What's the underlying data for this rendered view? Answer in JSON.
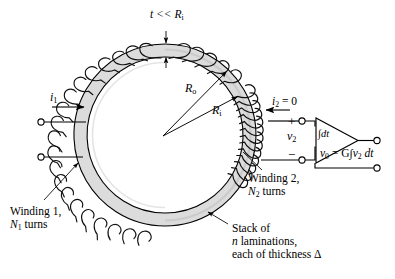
{
  "figure": {
    "colors": {
      "background": "#ffffff",
      "core_fill": "#dcdcdc",
      "core_fill_shade": "#cfcfcf",
      "line": "#000000",
      "wire": "#1a1a1a"
    }
  },
  "labels": {
    "thickness_note": {
      "text": "t << R",
      "sub": "i",
      "prefix_italic": "t"
    },
    "radius_outer": {
      "text": "R",
      "sub": "o"
    },
    "radius_inner": {
      "text": "R",
      "sub": "i"
    },
    "current_primary": {
      "text": "i",
      "sub": "1"
    },
    "current_secondary": {
      "text": "i",
      "sub": "2",
      "value": " = 0"
    },
    "terminal_plus": "+",
    "terminal_minus": "−",
    "voltage_secondary": {
      "text": "v",
      "sub": "2"
    },
    "integrator_block": "∫dt",
    "output_equation": {
      "v": "v",
      "sub_v": "0",
      "eq": " = G",
      "integral": "∫",
      "v2": "v",
      "sub_v2": "2",
      "dt": " dt"
    },
    "winding1_line1": "Winding 1,",
    "winding1_line2": {
      "n": "N",
      "sub": "1",
      "rest": " turns"
    },
    "winding2_line1": "Winding 2,",
    "winding2_line2": {
      "n": "N",
      "sub": "2",
      "rest": " turns"
    },
    "stack_line1": "Stack of",
    "stack_line2": {
      "n": "n",
      "rest": " laminations,"
    },
    "stack_line3": "each of thickness Δ"
  },
  "geometry": {
    "center_x": 165,
    "center_y": 135,
    "outer_radius": 91,
    "inner_radius": 78,
    "primary_terminal_top_y": 122,
    "primary_terminal_bottom_y": 157,
    "primary_terminal_x": 41,
    "secondary_terminal_x": 302,
    "secondary_terminal_top_y": 121,
    "secondary_terminal_bottom_y": 160,
    "output_terminal_x": 377,
    "amp_left_x": 318,
    "amp_right_x": 358
  }
}
